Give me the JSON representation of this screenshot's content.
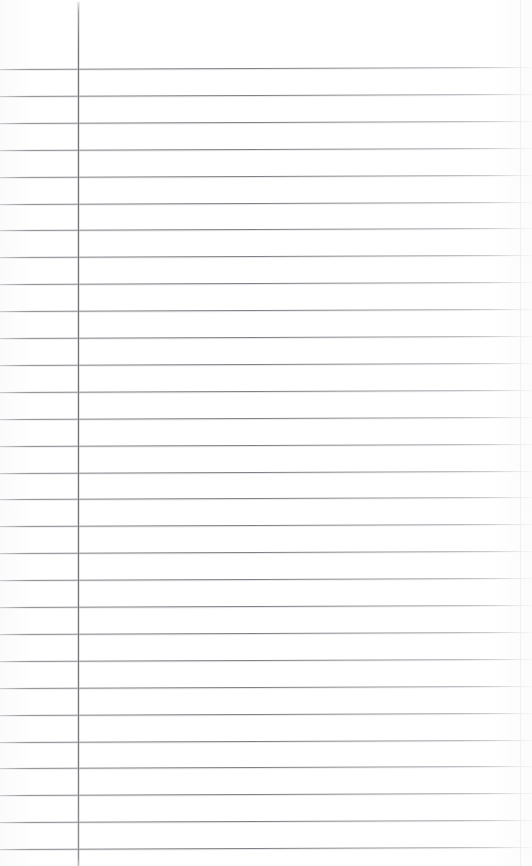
{
  "page": {
    "document_kind": "blank-lined-paper-scan",
    "width": 532,
    "height": 866,
    "background_color": "#ffffff",
    "content_text": "",
    "has_handwriting": "no",
    "has_printed_text": "no"
  },
  "colors": {
    "paper": "#ffffff",
    "rule_line": "#787880",
    "rule_line_light": "#a8a8ae",
    "margin_rule": "#70707a",
    "scan_seam": "#dedee4"
  },
  "margin_rule": {
    "name": "vertical-margin-line",
    "x": 78,
    "y_start": 2,
    "y_end": 866,
    "width_px": 1,
    "color": "#70707a",
    "orientation": "vertical"
  },
  "scan_seam": {
    "x": 520,
    "color": "#dedee4"
  },
  "ruling": {
    "style": "wide-ruled-horizontal",
    "line_count": 30,
    "spacing_px": 26.9,
    "first_line_y": 69,
    "last_line_y": 849,
    "line_color": "#787880",
    "line_thickness_px": 1,
    "skew_deg": -0.22,
    "header_zone_height": 69,
    "left_inset_px": 0,
    "right_extent_px": 532
  },
  "lines": [
    {
      "index": 1,
      "y": 69.0,
      "label": "rule-1"
    },
    {
      "index": 2,
      "y": 95.9,
      "label": "rule-2"
    },
    {
      "index": 3,
      "y": 122.8,
      "label": "rule-3"
    },
    {
      "index": 4,
      "y": 149.7,
      "label": "rule-4"
    },
    {
      "index": 5,
      "y": 176.6,
      "label": "rule-5"
    },
    {
      "index": 6,
      "y": 203.5,
      "label": "rule-6"
    },
    {
      "index": 7,
      "y": 230.4,
      "label": "rule-7"
    },
    {
      "index": 8,
      "y": 257.3,
      "label": "rule-8"
    },
    {
      "index": 9,
      "y": 284.2,
      "label": "rule-9"
    },
    {
      "index": 10,
      "y": 311.1,
      "label": "rule-10"
    },
    {
      "index": 11,
      "y": 338.0,
      "label": "rule-11"
    },
    {
      "index": 12,
      "y": 364.9,
      "label": "rule-12"
    },
    {
      "index": 13,
      "y": 391.8,
      "label": "rule-13"
    },
    {
      "index": 14,
      "y": 418.7,
      "label": "rule-14"
    },
    {
      "index": 15,
      "y": 445.6,
      "label": "rule-15"
    },
    {
      "index": 16,
      "y": 472.5,
      "label": "rule-16"
    },
    {
      "index": 17,
      "y": 499.4,
      "label": "rule-17"
    },
    {
      "index": 18,
      "y": 526.3,
      "label": "rule-18"
    },
    {
      "index": 19,
      "y": 553.2,
      "label": "rule-19"
    },
    {
      "index": 20,
      "y": 580.1,
      "label": "rule-20"
    },
    {
      "index": 21,
      "y": 607.0,
      "label": "rule-21"
    },
    {
      "index": 22,
      "y": 633.9,
      "label": "rule-22"
    },
    {
      "index": 23,
      "y": 660.8,
      "label": "rule-23"
    },
    {
      "index": 24,
      "y": 687.7,
      "label": "rule-24"
    },
    {
      "index": 25,
      "y": 714.6,
      "label": "rule-25"
    },
    {
      "index": 26,
      "y": 741.5,
      "label": "rule-26"
    },
    {
      "index": 27,
      "y": 768.4,
      "label": "rule-27"
    },
    {
      "index": 28,
      "y": 795.3,
      "label": "rule-28"
    },
    {
      "index": 29,
      "y": 822.2,
      "label": "rule-29"
    },
    {
      "index": 30,
      "y": 849.1,
      "label": "rule-30"
    }
  ]
}
